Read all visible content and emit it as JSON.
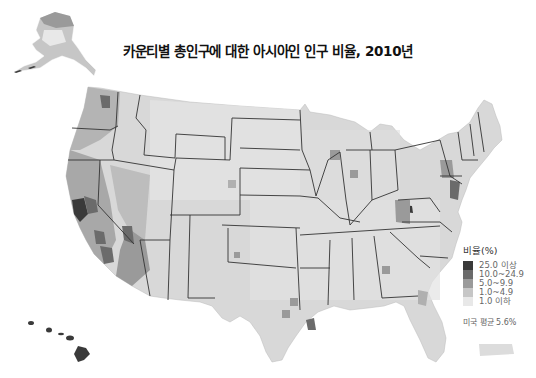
{
  "title": "카운티별 총인구에 대한 아시아인 인구 비율, 2010년",
  "legend": {
    "title": "비율(%)",
    "classes": [
      {
        "label": "25.0 이상",
        "color": "#3a3a3a"
      },
      {
        "label": "10.0~24.9",
        "color": "#6b6b6b"
      },
      {
        "label": "5.0~9.9",
        "color": "#9a9a9a"
      },
      {
        "label": "1.0~4.9",
        "color": "#c6c6c6"
      },
      {
        "label": "1.0 이하",
        "color": "#e8e8e8"
      }
    ],
    "us_average": "미국 평균 5.6%"
  },
  "map": {
    "regions": [
      "contiguous-us",
      "alaska",
      "hawaii",
      "puerto-rico"
    ],
    "border_color": "#333333",
    "county_border_color": "#ffffff"
  }
}
